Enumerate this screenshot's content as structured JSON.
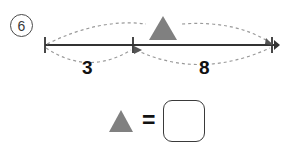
{
  "problem": {
    "number_label": "6",
    "number_icon": "circled-number",
    "unknown_symbol_icon": "gray-triangle",
    "equals_label": "=",
    "answer_value": "",
    "answer_placeholder": ""
  },
  "number_line": {
    "left_tick_label": "",
    "middle_tick_label": "",
    "right_tick_label": "",
    "left_span_label": "3",
    "right_span_label": "8",
    "arrow_icon": "right-arrowhead",
    "tick_icon": "tick-mark",
    "arc_icon": "dotted-arc"
  },
  "colors": {
    "line": "#333333",
    "triangle_fill": "#808080",
    "dotted_arc": "#9a9a9a",
    "text": "#111111",
    "box_border": "#3a3a3a"
  }
}
